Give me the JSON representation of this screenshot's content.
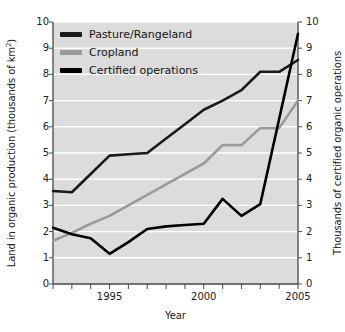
{
  "chart_data": {
    "type": "line",
    "title": "",
    "xlabel": "Year",
    "ylabel": "Land in organic production (thousands of km²)",
    "ylabel_right": "Thousands of certified organic operations",
    "x": [
      1992,
      1993,
      1994,
      1995,
      1996,
      1997,
      1998,
      1999,
      2000,
      2001,
      2002,
      2003,
      2004,
      2005
    ],
    "xlim": [
      1992,
      2005
    ],
    "ylim": [
      0,
      10
    ],
    "ylim_right": [
      0,
      10
    ],
    "yticks": [
      0,
      1,
      2,
      3,
      4,
      5,
      6,
      7,
      8,
      9,
      10
    ],
    "yticks_right": [
      0,
      1,
      2,
      3,
      4,
      5,
      6,
      7,
      8,
      9,
      10
    ],
    "xticks": [
      1992,
      1993,
      1994,
      1995,
      1996,
      1997,
      1998,
      1999,
      2000,
      2001,
      2002,
      2003,
      2004,
      2005
    ],
    "xtick_labels": [
      "",
      "",
      "",
      "1995",
      "",
      "",
      "",
      "",
      "2000",
      "",
      "",
      "",
      "",
      "2005"
    ],
    "grid": "horizontal",
    "legend_position": "top-left",
    "plot_background": "#dcdcdc",
    "gridline_color": "#ffffff",
    "series": [
      {
        "name": "Pasture/Rangeland",
        "axis": "left",
        "color": "#1a1a1a",
        "values": [
          3.55,
          3.5,
          4.2,
          4.9,
          4.95,
          5.0,
          5.55,
          6.1,
          6.65,
          7.0,
          7.4,
          8.1,
          8.1,
          8.55
        ]
      },
      {
        "name": "Cropland",
        "axis": "left",
        "color": "#9a9a9a",
        "values": [
          1.65,
          1.95,
          2.3,
          2.6,
          3.0,
          3.4,
          3.8,
          4.2,
          4.6,
          5.3,
          5.3,
          5.95,
          5.95,
          7.0
        ]
      },
      {
        "name": "Certified operations",
        "axis": "right",
        "color": "#000000",
        "values": [
          2.15,
          1.9,
          1.75,
          1.15,
          1.6,
          2.1,
          2.2,
          2.25,
          2.3,
          3.25,
          2.6,
          3.05,
          6.3,
          9.55
        ]
      }
    ]
  },
  "legend": {
    "items": [
      {
        "label": "Pasture/Rangeland",
        "color": "#1a1a1a"
      },
      {
        "label": "Cropland",
        "color": "#9a9a9a"
      },
      {
        "label": "Certified operations",
        "color": "#000000"
      }
    ]
  },
  "axes": {
    "x_title": "Year",
    "y_left_title_main": "Land in organic production (thousands of km",
    "y_left_title_sup": "2",
    "y_left_title_tail": ")",
    "y_right_title": "Thousands of certified organic operations"
  }
}
